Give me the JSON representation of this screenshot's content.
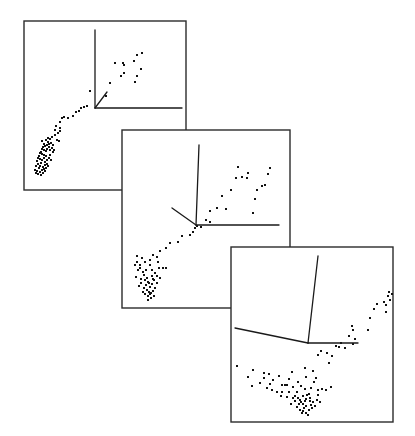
{
  "figure": {
    "background": "#ffffff",
    "frame_color": "#2b2b2b",
    "point_color": "#111111",
    "axis_color": "#1a1a1a"
  },
  "panels": [
    {
      "id": "panel-1",
      "frame": {
        "x": 24,
        "y": 21,
        "w": 162,
        "h": 169
      },
      "axes": {
        "origin": [
          95,
          108
        ],
        "ends": [
          [
            95,
            30
          ],
          [
            182,
            108
          ],
          [
            107,
            92
          ]
        ]
      },
      "points": [
        [
          137,
          55
        ],
        [
          142,
          53
        ],
        [
          115,
          63
        ],
        [
          123,
          63
        ],
        [
          124,
          65
        ],
        [
          134,
          61
        ],
        [
          141,
          69
        ],
        [
          137,
          76
        ],
        [
          124,
          73
        ],
        [
          121,
          76
        ],
        [
          110,
          83
        ],
        [
          135,
          82
        ],
        [
          90,
          91
        ],
        [
          106,
          96
        ],
        [
          87,
          106
        ],
        [
          84,
          107
        ],
        [
          81,
          108
        ],
        [
          79,
          111
        ],
        [
          76,
          112
        ],
        [
          73,
          116
        ],
        [
          68,
          118
        ],
        [
          62,
          118
        ],
        [
          64,
          117
        ],
        [
          60,
          122
        ],
        [
          56,
          126
        ],
        [
          60,
          128
        ],
        [
          60,
          131
        ],
        [
          59,
          141
        ],
        [
          57,
          140
        ],
        [
          55,
          130
        ],
        [
          52,
          137
        ],
        [
          50,
          139
        ],
        [
          48,
          142
        ],
        [
          49,
          144
        ],
        [
          47,
          145
        ],
        [
          45,
          146
        ],
        [
          43,
          147
        ],
        [
          42,
          149
        ],
        [
          44,
          150
        ],
        [
          46,
          151
        ],
        [
          41,
          152
        ],
        [
          40,
          153
        ],
        [
          42,
          154
        ],
        [
          44,
          155
        ],
        [
          46,
          156
        ],
        [
          39,
          156
        ],
        [
          38,
          158
        ],
        [
          40,
          159
        ],
        [
          42,
          160
        ],
        [
          44,
          158
        ],
        [
          47,
          160
        ],
        [
          49,
          158
        ],
        [
          50,
          155
        ],
        [
          45,
          162
        ],
        [
          41,
          163
        ],
        [
          37,
          161
        ],
        [
          38,
          164
        ],
        [
          40,
          166
        ],
        [
          43,
          167
        ],
        [
          45,
          165
        ],
        [
          47,
          164
        ],
        [
          39,
          168
        ],
        [
          36,
          166
        ],
        [
          35,
          170
        ],
        [
          37,
          171
        ],
        [
          40,
          172
        ],
        [
          42,
          170
        ],
        [
          44,
          169
        ],
        [
          46,
          168
        ],
        [
          48,
          166
        ],
        [
          41,
          175
        ],
        [
          38,
          174
        ],
        [
          36,
          173
        ],
        [
          43,
          173
        ],
        [
          45,
          171
        ],
        [
          50,
          150
        ],
        [
          52,
          148
        ],
        [
          53,
          145
        ],
        [
          51,
          143
        ],
        [
          49,
          147
        ],
        [
          47,
          149
        ],
        [
          44,
          144
        ],
        [
          42,
          141
        ],
        [
          46,
          140
        ],
        [
          48,
          138
        ],
        [
          55,
          135
        ],
        [
          58,
          133
        ],
        [
          54,
          150
        ],
        [
          53,
          152
        ],
        [
          51,
          160
        ]
      ]
    },
    {
      "id": "panel-2",
      "frame": {
        "x": 122,
        "y": 130,
        "w": 168,
        "h": 178
      },
      "axes": {
        "origin": [
          196,
          225
        ],
        "ends": [
          [
            199,
            145
          ],
          [
            279,
            225
          ],
          [
            172,
            208
          ]
        ]
      },
      "points": [
        [
          238,
          167
        ],
        [
          242,
          177
        ],
        [
          248,
          173
        ],
        [
          247,
          178
        ],
        [
          268,
          174
        ],
        [
          270,
          168
        ],
        [
          257,
          190
        ],
        [
          255,
          199
        ],
        [
          262,
          186
        ],
        [
          265,
          185
        ],
        [
          253,
          213
        ],
        [
          236,
          178
        ],
        [
          231,
          190
        ],
        [
          222,
          196
        ],
        [
          217,
          208
        ],
        [
          226,
          209
        ],
        [
          210,
          211
        ],
        [
          210,
          222
        ],
        [
          206,
          220
        ],
        [
          201,
          227
        ],
        [
          197,
          226
        ],
        [
          195,
          228
        ],
        [
          193,
          232
        ],
        [
          190,
          235
        ],
        [
          182,
          236
        ],
        [
          178,
          242
        ],
        [
          170,
          243
        ],
        [
          166,
          248
        ],
        [
          160,
          251
        ],
        [
          157,
          257
        ],
        [
          153,
          255
        ],
        [
          150,
          260
        ],
        [
          145,
          262
        ],
        [
          142,
          258
        ],
        [
          137,
          256
        ],
        [
          137,
          262
        ],
        [
          140,
          268
        ],
        [
          143,
          272
        ],
        [
          138,
          270
        ],
        [
          136,
          277
        ],
        [
          144,
          275
        ],
        [
          147,
          278
        ],
        [
          150,
          265
        ],
        [
          152,
          270
        ],
        [
          155,
          273
        ],
        [
          148,
          282
        ],
        [
          146,
          285
        ],
        [
          150,
          287
        ],
        [
          152,
          284
        ],
        [
          154,
          280
        ],
        [
          157,
          283
        ],
        [
          141,
          283
        ],
        [
          144,
          288
        ],
        [
          147,
          290
        ],
        [
          149,
          292
        ],
        [
          151,
          293
        ],
        [
          145,
          294
        ],
        [
          148,
          296
        ],
        [
          153,
          291
        ],
        [
          155,
          288
        ],
        [
          158,
          262
        ],
        [
          159,
          268
        ],
        [
          140,
          265
        ],
        [
          135,
          265
        ],
        [
          163,
          268
        ],
        [
          141,
          279
        ],
        [
          149,
          283
        ],
        [
          152,
          276
        ],
        [
          153,
          279
        ],
        [
          146,
          270
        ],
        [
          150,
          294
        ],
        [
          143,
          292
        ],
        [
          139,
          286
        ],
        [
          157,
          276
        ],
        [
          160,
          278
        ],
        [
          166,
          268
        ],
        [
          145,
          280
        ],
        [
          154,
          296
        ],
        [
          148,
          300
        ],
        [
          151,
          298
        ]
      ]
    },
    {
      "id": "panel-3",
      "frame": {
        "x": 231,
        "y": 247,
        "w": 162,
        "h": 175
      },
      "axes": {
        "origin": [
          308,
          343
        ],
        "ends": [
          [
            318,
            256
          ],
          [
            358,
            343
          ],
          [
            235,
            328
          ]
        ]
      },
      "points": [
        [
          389,
          292
        ],
        [
          392,
          294
        ],
        [
          388,
          296
        ],
        [
          384,
          302
        ],
        [
          386,
          305
        ],
        [
          390,
          300
        ],
        [
          386,
          312
        ],
        [
          377,
          304
        ],
        [
          374,
          309
        ],
        [
          370,
          318
        ],
        [
          368,
          330
        ],
        [
          352,
          326
        ],
        [
          349,
          336
        ],
        [
          353,
          330
        ],
        [
          355,
          339
        ],
        [
          353,
          344
        ],
        [
          345,
          348
        ],
        [
          339,
          347
        ],
        [
          341,
          343
        ],
        [
          336,
          346
        ],
        [
          327,
          353
        ],
        [
          321,
          351
        ],
        [
          318,
          355
        ],
        [
          332,
          356
        ],
        [
          329,
          363
        ],
        [
          305,
          368
        ],
        [
          313,
          371
        ],
        [
          306,
          377
        ],
        [
          292,
          372
        ],
        [
          287,
          385
        ],
        [
          282,
          385
        ],
        [
          273,
          380
        ],
        [
          269,
          374
        ],
        [
          264,
          373
        ],
        [
          253,
          370
        ],
        [
          237,
          366
        ],
        [
          248,
          377
        ],
        [
          252,
          386
        ],
        [
          260,
          383
        ],
        [
          264,
          378
        ],
        [
          270,
          384
        ],
        [
          272,
          390
        ],
        [
          277,
          392
        ],
        [
          282,
          392
        ],
        [
          289,
          392
        ],
        [
          293,
          387
        ],
        [
          298,
          382
        ],
        [
          301,
          386
        ],
        [
          297,
          392
        ],
        [
          305,
          389
        ],
        [
          311,
          388
        ],
        [
          314,
          382
        ],
        [
          316,
          378
        ],
        [
          309,
          394
        ],
        [
          303,
          396
        ],
        [
          306,
          399
        ],
        [
          301,
          402
        ],
        [
          295,
          396
        ],
        [
          298,
          398
        ],
        [
          307,
          395
        ],
        [
          310,
          398
        ],
        [
          313,
          402
        ],
        [
          311,
          405
        ],
        [
          306,
          406
        ],
        [
          303,
          404
        ],
        [
          299,
          404
        ],
        [
          297,
          407
        ],
        [
          300,
          410
        ],
        [
          303,
          411
        ],
        [
          306,
          413
        ],
        [
          309,
          410
        ],
        [
          312,
          408
        ],
        [
          315,
          406
        ],
        [
          317,
          400
        ],
        [
          318,
          395
        ],
        [
          320,
          402
        ],
        [
          295,
          401
        ],
        [
          293,
          398
        ],
        [
          291,
          404
        ],
        [
          310,
          401
        ],
        [
          318,
          390
        ],
        [
          322,
          389
        ],
        [
          326,
          390
        ],
        [
          331,
          387
        ],
        [
          285,
          385
        ],
        [
          289,
          379
        ],
        [
          279,
          376
        ],
        [
          267,
          388
        ],
        [
          281,
          396
        ],
        [
          287,
          397
        ],
        [
          305,
          401
        ],
        [
          302,
          413
        ],
        [
          308,
          415
        ],
        [
          304,
          408
        ],
        [
          300,
          400
        ]
      ]
    }
  ]
}
